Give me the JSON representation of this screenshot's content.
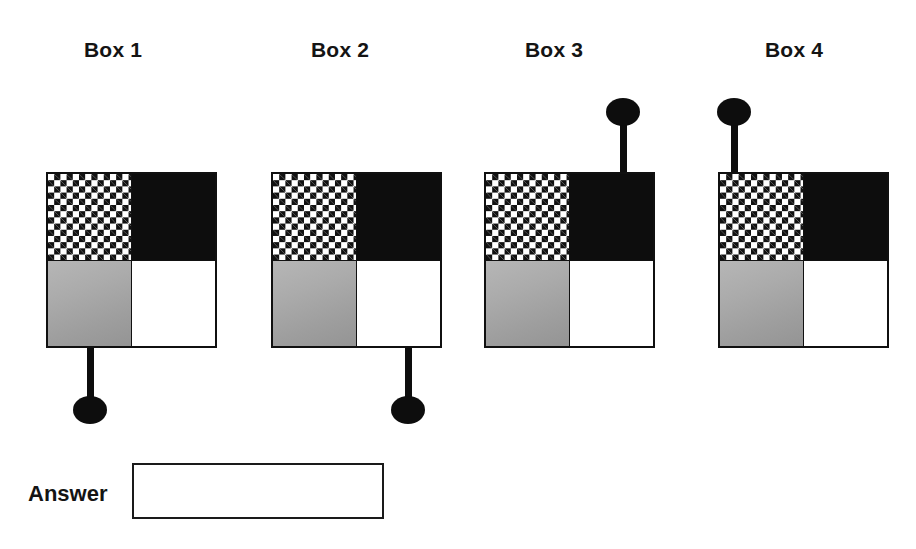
{
  "page": {
    "background_color": "#ffffff"
  },
  "colors": {
    "ink": "#0d0d0d",
    "checker_dark": "#111111",
    "checker_light": "#ffffff",
    "solid_black": "#0d0d0d",
    "gray_light": "#b6b6b6",
    "gray_dark": "#949494",
    "white_quadrant": "#ffffff",
    "border": "#101010"
  },
  "boxes": [
    {
      "label": "Box 1",
      "label_left": 84,
      "label_top": 38,
      "box_left": 46,
      "box_top": 172,
      "quadrants": {
        "top_left": "checkered",
        "top_right": "black",
        "bottom_left": "gray-gradient",
        "bottom_right": "white"
      },
      "stem": {
        "direction": "down",
        "attached_quadrant": "bottom-left",
        "stem_left": 87,
        "stem_top": 346,
        "stem_height": 52,
        "knob_left": 73,
        "knob_top": 396
      }
    },
    {
      "label": "Box 2",
      "label_left": 311,
      "label_top": 38,
      "box_left": 271,
      "box_top": 172,
      "quadrants": {
        "top_left": "checkered",
        "top_right": "black",
        "bottom_left": "gray-gradient",
        "bottom_right": "white"
      },
      "stem": {
        "direction": "down",
        "attached_quadrant": "bottom-right",
        "stem_left": 405,
        "stem_top": 346,
        "stem_height": 52,
        "knob_left": 391,
        "knob_top": 396
      }
    },
    {
      "label": "Box 3",
      "label_left": 525,
      "label_top": 38,
      "box_left": 484,
      "box_top": 172,
      "quadrants": {
        "top_left": "checkered",
        "top_right": "black",
        "bottom_left": "gray-gradient",
        "bottom_right": "white"
      },
      "stem": {
        "direction": "up",
        "attached_quadrant": "top-right",
        "stem_left": 620,
        "stem_top": 122,
        "stem_height": 52,
        "knob_left": 606,
        "knob_top": 98
      }
    },
    {
      "label": "Box 4",
      "label_left": 765,
      "label_top": 38,
      "box_left": 718,
      "box_top": 172,
      "quadrants": {
        "top_left": "checkered",
        "top_right": "black",
        "bottom_left": "gray-gradient",
        "bottom_right": "white"
      },
      "stem": {
        "direction": "up",
        "attached_quadrant": "top-left",
        "stem_left": 730,
        "stem_top": 122,
        "stem_height": 52,
        "knob_left": 716,
        "knob_top": 98
      }
    }
  ],
  "answer": {
    "label": "Answer",
    "label_left": 28,
    "label_top": 481,
    "value": "",
    "placeholder": "",
    "box_left": 132,
    "box_top": 463,
    "box_width": 252,
    "box_height": 56
  }
}
